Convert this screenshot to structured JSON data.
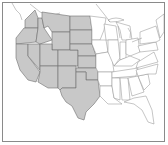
{
  "map": {
    "title": "",
    "region": "Contiguous United States",
    "style": "grayscale outline map",
    "colors": {
      "background": "#ffffff",
      "highlighted_fill": "#c8c8c8",
      "border_stroke": "#6e6e6e",
      "unhighlighted_fill": "#ffffff"
    },
    "highlighted_states": [
      "Washington",
      "Oregon",
      "California",
      "Nevada",
      "Idaho",
      "Montana",
      "Wyoming",
      "Utah",
      "Colorado",
      "Arizona",
      "New Mexico",
      "North Dakota",
      "South Dakota",
      "Nebraska",
      "Kansas",
      "Oklahoma",
      "Texas"
    ],
    "unhighlighted_states": [
      "Minnesota",
      "Iowa",
      "Missouri",
      "Arkansas",
      "Louisiana",
      "Wisconsin",
      "Illinois",
      "Michigan",
      "Indiana",
      "Ohio",
      "Kentucky",
      "Tennessee",
      "Mississippi",
      "Alabama",
      "Georgia",
      "Florida",
      "South Carolina",
      "North Carolina",
      "Virginia",
      "West Virginia",
      "Pennsylvania",
      "New York",
      "New England"
    ]
  }
}
